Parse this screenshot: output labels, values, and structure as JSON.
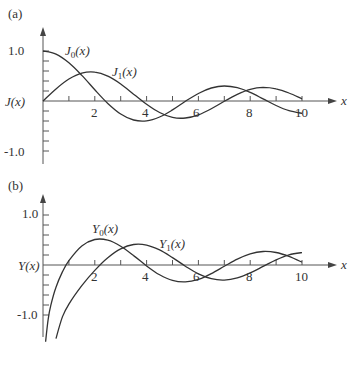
{
  "chart_data": [
    {
      "type": "line",
      "panel_label": "(a)",
      "ylabel": "J(x)",
      "xlabel": "x",
      "xlim": [
        0,
        10
      ],
      "ylim": [
        -1.0,
        1.0
      ],
      "x_tick_labels": [
        "2",
        "4",
        "6",
        "8",
        "10"
      ],
      "y_tick_labels": [
        "1.0",
        "-1.0"
      ],
      "grid": false,
      "series": [
        {
          "name": "J0(x)",
          "label_main": "J",
          "label_sub": "0",
          "label_arg": "(x)",
          "x": [
            0,
            0.5,
            1,
            1.5,
            2,
            2.5,
            3,
            3.5,
            4,
            4.5,
            5,
            5.5,
            6,
            6.5,
            7,
            7.5,
            8,
            8.5,
            9,
            9.5,
            10
          ],
          "values": [
            1.0,
            0.938,
            0.765,
            0.512,
            0.224,
            -0.048,
            -0.26,
            -0.38,
            -0.397,
            -0.321,
            -0.178,
            -0.007,
            0.151,
            0.26,
            0.3,
            0.266,
            0.172,
            0.042,
            -0.09,
            -0.194,
            -0.246
          ]
        },
        {
          "name": "J1(x)",
          "label_main": "J",
          "label_sub": "1",
          "label_arg": "(x)",
          "x": [
            0,
            0.5,
            1,
            1.5,
            2,
            2.5,
            3,
            3.5,
            4,
            4.5,
            5,
            5.5,
            6,
            6.5,
            7,
            7.5,
            8,
            8.5,
            9,
            9.5,
            10
          ],
          "values": [
            0.0,
            0.242,
            0.44,
            0.558,
            0.577,
            0.497,
            0.339,
            0.137,
            -0.066,
            -0.231,
            -0.328,
            -0.341,
            -0.277,
            -0.154,
            -0.005,
            0.135,
            0.235,
            0.273,
            0.245,
            0.161,
            0.043
          ]
        }
      ]
    },
    {
      "type": "line",
      "panel_label": "(b)",
      "ylabel": "Y(x)",
      "xlabel": "x",
      "xlim": [
        0,
        10
      ],
      "ylim": [
        -1.0,
        1.0
      ],
      "x_tick_labels": [
        "2",
        "4",
        "6",
        "8",
        "10"
      ],
      "y_tick_labels": [
        "1.0",
        "-1.0"
      ],
      "grid": false,
      "series": [
        {
          "name": "Y0(x)",
          "label_main": "Y",
          "label_sub": "0",
          "label_arg": "(x)",
          "x": [
            0.1,
            0.2,
            0.3,
            0.5,
            0.75,
            1,
            1.5,
            2,
            2.5,
            3,
            3.5,
            4,
            4.5,
            5,
            5.5,
            6,
            6.5,
            7,
            7.5,
            8,
            8.5,
            9,
            9.5,
            10
          ],
          "values": [
            -1.534,
            -1.081,
            -0.807,
            -0.445,
            -0.137,
            0.088,
            0.382,
            0.51,
            0.498,
            0.377,
            0.189,
            -0.017,
            -0.195,
            -0.309,
            -0.339,
            -0.288,
            -0.173,
            -0.026,
            0.118,
            0.224,
            0.27,
            0.25,
            0.171,
            0.056
          ]
        },
        {
          "name": "Y1(x)",
          "label_main": "Y",
          "label_sub": "1",
          "label_arg": "(x)",
          "x": [
            0.4,
            0.5,
            0.75,
            1,
            1.5,
            2,
            2.5,
            3,
            3.5,
            4,
            4.5,
            5,
            5.5,
            6,
            6.5,
            7,
            7.5,
            8,
            8.5,
            9,
            9.5,
            10
          ],
          "values": [
            -1.781,
            -1.471,
            -1.038,
            -0.781,
            -0.412,
            -0.107,
            0.146,
            0.325,
            0.41,
            0.398,
            0.301,
            0.148,
            -0.024,
            -0.175,
            -0.274,
            -0.303,
            -0.259,
            -0.158,
            -0.028,
            0.104,
            0.203,
            0.249
          ]
        }
      ]
    }
  ]
}
